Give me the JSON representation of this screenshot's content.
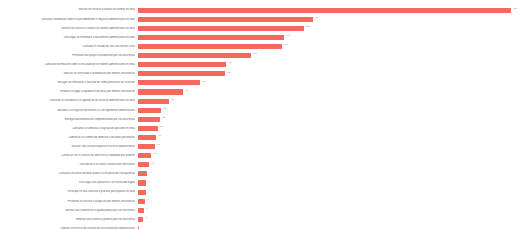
{
  "chart_data": {
    "type": "bar",
    "orientation": "horizontal",
    "title": "",
    "subtitle": "",
    "xlabel": "",
    "ylabel": "",
    "grid": false,
    "legend": false,
    "axes_visible": false,
    "sorted": "descending",
    "bar_color": "#f4685e",
    "label_color": "#5a5a62",
    "value_label_color": "#8e8e96",
    "background": "#ffffff",
    "xlim": [
      0,
      372
    ],
    "note": "Category label text is rendered at sub-pixel size in the source screenshot and is not legible; strings below reproduce the visible line lengths and tone only.",
    "categories": [
      "Solicitar un servicio o realizar un tramite en linea",
      "Consultar informacion sobre un procedimiento o requisito administrativo en linea",
      "Obtener un servicio o realizar un tramite administrativo en linea",
      "Descargar un formulario o documento administrativo en linea",
      "Consultar el estado de una solicitud en curso",
      "Presentar una queja o reclamacion por via electronica",
      "Consultar informacion sobre el resultado de un tramite administrativo en linea",
      "Solicitar un certificado o acreditacion por medios electronicos",
      "Recoger un formulario o solicitud de forma presencial en la oficina",
      "Realizar un pago o liquidacion de tasas por medios electronicos",
      "Consultar el calendario o la agenda de un servicio administrativo en linea",
      "Acceder a un registro electronico o a un expediente administrativo",
      "Entregar documentacion complementaria por via electronica",
      "Consultar la normativa o legislacion aplicable en linea",
      "Comunicar un cambio de domicilio o de datos personales",
      "Solicitar una cita previa para un servicio administrativo",
      "Contactar con el servicio de atencion al ciudadano por telefono",
      "Suscribirse a un aviso o notificacion electronica",
      "Consultar una base de datos publica o un portal de transparencia",
      "Descargar una aplicacion o un certificado digital",
      "Participar en una consulta o proceso participativo en linea",
      "Presentar un recurso o alegacion por medios electronicos",
      "Solicitar una subvencion o ayuda publica por via electronica",
      "Renovar una licencia o permiso por via electronica",
      "Tramitar un recurso de revision de una resolucion administrativa"
    ],
    "values": [
      371,
      174,
      165,
      145,
      143,
      112,
      88,
      87,
      62,
      45,
      31,
      23,
      22,
      20,
      18,
      17,
      13,
      11,
      9,
      8,
      8,
      7,
      6,
      5,
      1
    ],
    "value_labels": [
      "371",
      "174",
      "165",
      "145",
      "143",
      "112",
      "88",
      "87",
      "62",
      "45",
      "31",
      "23",
      "22",
      "20",
      "18",
      "17",
      "13",
      "11",
      "9",
      "8",
      "8",
      "7",
      "6",
      "5",
      "1"
    ]
  },
  "layout": {
    "plot_left_px": 138,
    "plot_right_px": 512,
    "row_pitch_px": 9.1,
    "bar_height_px": 5.2,
    "first_row_top_px": 5.5
  }
}
